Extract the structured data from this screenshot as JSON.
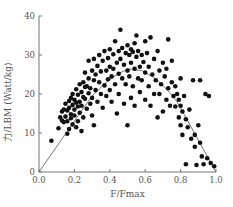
{
  "chart_data": {
    "type": "scatter",
    "title": "",
    "xlabel": "F/Fmax",
    "ylabel": "力/LBM (Watt/kg)",
    "xlim": [
      0,
      1.0
    ],
    "ylim": [
      0,
      40
    ],
    "xticks": [
      "0.0",
      "0.2",
      "0.4",
      "0.6",
      "0.8",
      "1.0"
    ],
    "xtick_values": [
      0,
      0.2,
      0.4,
      0.6,
      0.8,
      1.0
    ],
    "yticks": [
      "0",
      "10",
      "20",
      "30",
      "40"
    ],
    "ytick_values": [
      0,
      10,
      20,
      30,
      40
    ],
    "grid": false,
    "legend": "none",
    "point_color": "#111111",
    "line_color": "#666666",
    "fit_curve": {
      "name": "power-velocity envelope",
      "x": [
        0.0,
        0.23,
        0.3,
        0.38,
        0.45,
        0.51,
        0.58,
        0.65,
        0.72,
        0.78,
        1.0
      ],
      "y": [
        0.0,
        15.0,
        19.5,
        23.0,
        25.3,
        26.4,
        26.0,
        24.2,
        21.3,
        18.0,
        0.0
      ]
    },
    "points": [
      [
        0.07,
        8.0
      ],
      [
        0.11,
        11.2
      ],
      [
        0.12,
        14.0
      ],
      [
        0.13,
        13.2
      ],
      [
        0.13,
        15.5
      ],
      [
        0.14,
        12.8
      ],
      [
        0.14,
        16.0
      ],
      [
        0.15,
        14.2
      ],
      [
        0.15,
        17.5
      ],
      [
        0.16,
        13.0
      ],
      [
        0.16,
        9.8
      ],
      [
        0.16,
        15.8
      ],
      [
        0.17,
        18.2
      ],
      [
        0.17,
        16.5
      ],
      [
        0.17,
        11.0
      ],
      [
        0.18,
        14.8
      ],
      [
        0.18,
        19.0
      ],
      [
        0.18,
        13.8
      ],
      [
        0.19,
        17.2
      ],
      [
        0.19,
        20.0
      ],
      [
        0.19,
        12.2
      ],
      [
        0.2,
        16.0
      ],
      [
        0.2,
        18.5
      ],
      [
        0.2,
        14.5
      ],
      [
        0.21,
        21.2
      ],
      [
        0.21,
        17.8
      ],
      [
        0.21,
        11.5
      ],
      [
        0.22,
        19.8
      ],
      [
        0.22,
        16.8
      ],
      [
        0.22,
        13.0
      ],
      [
        0.23,
        22.5
      ],
      [
        0.23,
        18.0
      ],
      [
        0.23,
        15.2
      ],
      [
        0.24,
        20.5
      ],
      [
        0.24,
        17.0
      ],
      [
        0.24,
        10.5
      ],
      [
        0.25,
        23.0
      ],
      [
        0.25,
        19.2
      ],
      [
        0.25,
        14.0
      ],
      [
        0.26,
        21.8
      ],
      [
        0.26,
        18.8
      ],
      [
        0.26,
        25.5
      ],
      [
        0.27,
        16.2
      ],
      [
        0.27,
        22.0
      ],
      [
        0.28,
        20.2
      ],
      [
        0.28,
        24.0
      ],
      [
        0.28,
        28.5
      ],
      [
        0.29,
        17.5
      ],
      [
        0.29,
        21.5
      ],
      [
        0.3,
        26.0
      ],
      [
        0.3,
        19.0
      ],
      [
        0.3,
        14.5
      ],
      [
        0.31,
        23.5
      ],
      [
        0.31,
        29.0
      ],
      [
        0.31,
        12.0
      ],
      [
        0.32,
        25.0
      ],
      [
        0.32,
        21.0
      ],
      [
        0.33,
        27.2
      ],
      [
        0.33,
        18.0
      ],
      [
        0.34,
        23.0
      ],
      [
        0.34,
        30.0
      ],
      [
        0.35,
        20.0
      ],
      [
        0.35,
        25.8
      ],
      [
        0.36,
        28.5
      ],
      [
        0.36,
        16.5
      ],
      [
        0.37,
        22.2
      ],
      [
        0.37,
        31.0
      ],
      [
        0.38,
        26.0
      ],
      [
        0.38,
        19.5
      ],
      [
        0.39,
        29.2
      ],
      [
        0.39,
        23.8
      ],
      [
        0.4,
        31.5
      ],
      [
        0.4,
        27.0
      ],
      [
        0.4,
        21.0
      ],
      [
        0.41,
        24.5
      ],
      [
        0.41,
        18.0
      ],
      [
        0.42,
        30.2
      ],
      [
        0.42,
        26.5
      ],
      [
        0.43,
        33.5
      ],
      [
        0.43,
        22.5
      ],
      [
        0.44,
        28.0
      ],
      [
        0.44,
        15.0
      ],
      [
        0.45,
        31.0
      ],
      [
        0.45,
        25.2
      ],
      [
        0.45,
        20.0
      ],
      [
        0.46,
        29.0
      ],
      [
        0.46,
        36.5
      ],
      [
        0.47,
        24.0
      ],
      [
        0.47,
        31.8
      ],
      [
        0.48,
        27.5
      ],
      [
        0.48,
        17.5
      ],
      [
        0.49,
        30.5
      ],
      [
        0.49,
        22.5
      ],
      [
        0.5,
        32.5
      ],
      [
        0.5,
        26.0
      ],
      [
        0.5,
        12.0
      ],
      [
        0.51,
        30.0
      ],
      [
        0.51,
        24.5
      ],
      [
        0.52,
        31.5
      ],
      [
        0.52,
        28.0
      ],
      [
        0.52,
        19.0
      ],
      [
        0.53,
        30.8
      ],
      [
        0.53,
        22.0
      ],
      [
        0.54,
        33.0
      ],
      [
        0.54,
        26.5
      ],
      [
        0.54,
        17.0
      ],
      [
        0.55,
        29.5
      ],
      [
        0.55,
        35.0
      ],
      [
        0.56,
        24.0
      ],
      [
        0.56,
        31.0
      ],
      [
        0.57,
        27.0
      ],
      [
        0.57,
        20.5
      ],
      [
        0.58,
        30.0
      ],
      [
        0.58,
        23.5
      ],
      [
        0.59,
        28.2
      ],
      [
        0.6,
        25.5
      ],
      [
        0.6,
        33.5
      ],
      [
        0.6,
        18.5
      ],
      [
        0.61,
        30.5
      ],
      [
        0.62,
        22.0
      ],
      [
        0.62,
        27.0
      ],
      [
        0.63,
        34.5
      ],
      [
        0.63,
        17.0
      ],
      [
        0.64,
        25.0
      ],
      [
        0.65,
        29.0
      ],
      [
        0.65,
        20.0
      ],
      [
        0.66,
        23.5
      ],
      [
        0.67,
        31.0
      ],
      [
        0.67,
        14.0
      ],
      [
        0.68,
        26.0
      ],
      [
        0.68,
        20.0
      ],
      [
        0.69,
        22.5
      ],
      [
        0.7,
        28.0
      ],
      [
        0.7,
        15.5
      ],
      [
        0.71,
        24.5
      ],
      [
        0.72,
        18.5
      ],
      [
        0.72,
        26.5
      ],
      [
        0.73,
        21.5
      ],
      [
        0.73,
        34.0
      ],
      [
        0.74,
        17.0
      ],
      [
        0.75,
        23.0
      ],
      [
        0.75,
        28.5
      ],
      [
        0.76,
        19.5
      ],
      [
        0.77,
        16.8
      ],
      [
        0.77,
        22.0
      ],
      [
        0.78,
        20.0
      ],
      [
        0.79,
        14.0
      ],
      [
        0.79,
        18.5
      ],
      [
        0.8,
        12.0
      ],
      [
        0.8,
        17.0
      ],
      [
        0.8,
        24.0
      ],
      [
        0.81,
        9.5
      ],
      [
        0.81,
        15.5
      ],
      [
        0.82,
        19.5
      ],
      [
        0.83,
        13.5
      ],
      [
        0.83,
        2.0
      ],
      [
        0.84,
        11.5
      ],
      [
        0.85,
        16.0
      ],
      [
        0.86,
        8.5
      ],
      [
        0.87,
        23.5
      ],
      [
        0.88,
        6.5
      ],
      [
        0.88,
        9.5
      ],
      [
        0.89,
        1.8
      ],
      [
        0.9,
        12.0
      ],
      [
        0.91,
        7.5
      ],
      [
        0.91,
        23.5
      ],
      [
        0.92,
        4.0
      ],
      [
        0.93,
        2.0
      ],
      [
        0.94,
        20.0
      ],
      [
        0.95,
        3.5
      ],
      [
        0.96,
        19.5
      ],
      [
        0.97,
        2.3
      ],
      [
        0.99,
        1.5
      ]
    ]
  }
}
